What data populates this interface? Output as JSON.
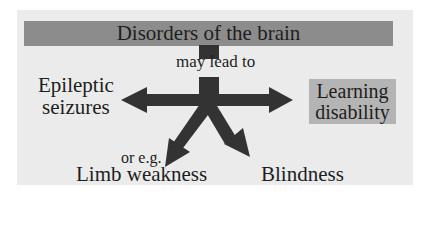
{
  "diagram": {
    "title": "Disorders of the brain",
    "connector_label": "may lead to",
    "outcomes": {
      "left": {
        "line1": "Epileptic",
        "line2": "seizures"
      },
      "right": {
        "line1": "Learning",
        "line2": "disability"
      },
      "bottom_left_prefix": "or e.g.",
      "bottom_left": "Limb weakness",
      "bottom_right": "Blindness"
    },
    "colors": {
      "background": "#ebebeb",
      "title_bar": "#8c8c8c",
      "highlight_box": "#b4b4b4",
      "arrows": "#333333",
      "text": "#1e1e1e"
    }
  }
}
